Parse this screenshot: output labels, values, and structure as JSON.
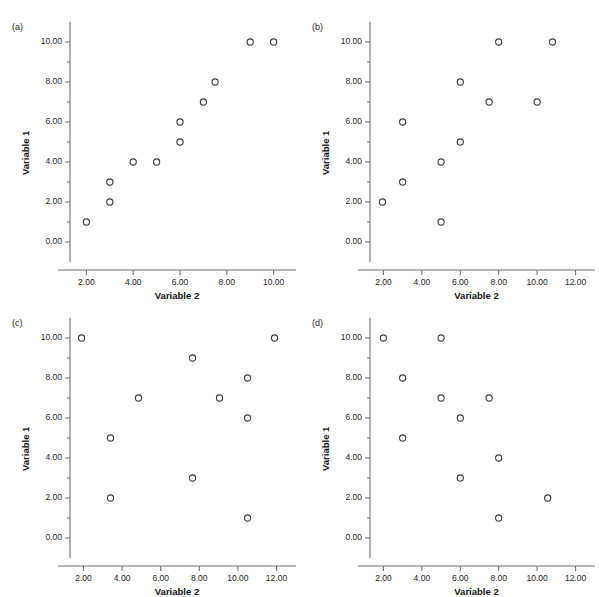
{
  "figure": {
    "background": "#ffffff",
    "marker_color": "#3a3a3a",
    "axis_color": "#6f6f6f",
    "panel_count": 4
  },
  "panels": [
    {
      "label": "(a)",
      "xlabel": "Variable 2",
      "ylabel": "Variable 1",
      "xticks": [
        "2.00",
        "4.00",
        "6.00",
        "8.00",
        "10.00"
      ],
      "xtick_values": [
        2,
        4,
        6,
        8,
        10
      ],
      "yticks": [
        "0.00",
        "2.00",
        "4.00",
        "6.00",
        "8.00",
        "10.00"
      ],
      "ytick_values": [
        0,
        2,
        4,
        6,
        8,
        10
      ],
      "xlim": [
        1.3,
        10.7
      ],
      "ylim": [
        -0.7,
        10.6
      ],
      "points": [
        {
          "x": 2.0,
          "y": 1.0
        },
        {
          "x": 3.0,
          "y": 2.0
        },
        {
          "x": 3.0,
          "y": 3.0
        },
        {
          "x": 4.0,
          "y": 4.0
        },
        {
          "x": 5.0,
          "y": 4.0
        },
        {
          "x": 6.0,
          "y": 5.0
        },
        {
          "x": 6.0,
          "y": 6.0
        },
        {
          "x": 7.0,
          "y": 7.0
        },
        {
          "x": 7.5,
          "y": 8.0
        },
        {
          "x": 9.0,
          "y": 10.0
        },
        {
          "x": 10.0,
          "y": 10.0
        }
      ]
    },
    {
      "label": "(b)",
      "xlabel": "Variable 2",
      "ylabel": "Variable 1",
      "xticks": [
        "2.00",
        "4.00",
        "6.00",
        "8.00",
        "10.00",
        "12.00"
      ],
      "xtick_values": [
        2,
        4,
        6,
        8,
        10,
        12
      ],
      "yticks": [
        "0.00",
        "2.00",
        "4.00",
        "6.00",
        "8.00",
        "10.00"
      ],
      "ytick_values": [
        0,
        2,
        4,
        6,
        8,
        10
      ],
      "xlim": [
        1.3,
        12.7
      ],
      "ylim": [
        -0.7,
        10.6
      ],
      "points": [
        {
          "x": 1.95,
          "y": 2.0
        },
        {
          "x": 3.0,
          "y": 3.0
        },
        {
          "x": 3.0,
          "y": 6.0
        },
        {
          "x": 5.0,
          "y": 1.0
        },
        {
          "x": 5.0,
          "y": 4.0
        },
        {
          "x": 6.0,
          "y": 5.0
        },
        {
          "x": 6.0,
          "y": 8.0
        },
        {
          "x": 7.5,
          "y": 7.0
        },
        {
          "x": 8.0,
          "y": 10.0
        },
        {
          "x": 10.0,
          "y": 7.0
        },
        {
          "x": 10.8,
          "y": 10.0
        }
      ]
    },
    {
      "label": "(c)",
      "xlabel": "Variable 2",
      "ylabel": "Variable 1",
      "xticks": [
        "2.00",
        "4.00",
        "6.00",
        "8.00",
        "10.00",
        "12.00"
      ],
      "xtick_values": [
        2,
        4,
        6,
        8,
        10,
        12
      ],
      "yticks": [
        "0.00",
        "2.00",
        "4.00",
        "6.00",
        "8.00",
        "10.00"
      ],
      "ytick_values": [
        0,
        2,
        4,
        6,
        8,
        10
      ],
      "xlim": [
        1.3,
        12.7
      ],
      "ylim": [
        -0.7,
        10.6
      ],
      "points": [
        {
          "x": 1.9,
          "y": 10.0
        },
        {
          "x": 3.4,
          "y": 2.0
        },
        {
          "x": 3.4,
          "y": 5.0
        },
        {
          "x": 4.85,
          "y": 7.0
        },
        {
          "x": 7.65,
          "y": 3.0
        },
        {
          "x": 7.65,
          "y": 9.0
        },
        {
          "x": 9.05,
          "y": 7.0
        },
        {
          "x": 10.5,
          "y": 1.0
        },
        {
          "x": 10.5,
          "y": 6.0
        },
        {
          "x": 10.5,
          "y": 8.0
        },
        {
          "x": 11.9,
          "y": 10.0
        }
      ]
    },
    {
      "label": "(d)",
      "xlabel": "Variable 2",
      "ylabel": "Variable 1",
      "xticks": [
        "2.00",
        "4.00",
        "6.00",
        "8.00",
        "10.00",
        "12.00"
      ],
      "xtick_values": [
        2,
        4,
        6,
        8,
        10,
        12
      ],
      "yticks": [
        "0.00",
        "2.00",
        "4.00",
        "6.00",
        "8.00",
        "10.00"
      ],
      "ytick_values": [
        0,
        2,
        4,
        6,
        8,
        10
      ],
      "xlim": [
        1.3,
        12.7
      ],
      "ylim": [
        -0.7,
        10.6
      ],
      "points": [
        {
          "x": 2.0,
          "y": 10.0
        },
        {
          "x": 3.0,
          "y": 5.0
        },
        {
          "x": 3.0,
          "y": 8.0
        },
        {
          "x": 5.0,
          "y": 7.0
        },
        {
          "x": 5.0,
          "y": 10.0
        },
        {
          "x": 6.0,
          "y": 3.0
        },
        {
          "x": 6.0,
          "y": 6.0
        },
        {
          "x": 7.5,
          "y": 7.0
        },
        {
          "x": 8.0,
          "y": 1.0
        },
        {
          "x": 8.0,
          "y": 4.0
        },
        {
          "x": 10.55,
          "y": 2.0
        }
      ]
    }
  ],
  "chart_data": [
    {
      "type": "scatter",
      "title": "(a)",
      "xlabel": "Variable 2",
      "ylabel": "Variable 1",
      "xlim": [
        1.3,
        10.7
      ],
      "ylim": [
        -0.7,
        10.6
      ],
      "xticks": [
        2,
        4,
        6,
        8,
        10
      ],
      "yticks": [
        0,
        2,
        4,
        6,
        8,
        10
      ],
      "grid": false,
      "legend": "none",
      "marker": "open-circle",
      "x": [
        2.0,
        3.0,
        3.0,
        4.0,
        5.0,
        6.0,
        6.0,
        7.0,
        7.5,
        9.0,
        10.0
      ],
      "y": [
        1.0,
        2.0,
        3.0,
        4.0,
        4.0,
        5.0,
        6.0,
        7.0,
        8.0,
        10.0,
        10.0
      ],
      "annotation": "strong positive linear relationship"
    },
    {
      "type": "scatter",
      "title": "(b)",
      "xlabel": "Variable 2",
      "ylabel": "Variable 1",
      "xlim": [
        1.3,
        12.7
      ],
      "ylim": [
        -0.7,
        10.6
      ],
      "xticks": [
        2,
        4,
        6,
        8,
        10,
        12
      ],
      "yticks": [
        0,
        2,
        4,
        6,
        8,
        10
      ],
      "grid": false,
      "legend": "none",
      "marker": "open-circle",
      "x": [
        1.95,
        3.0,
        3.0,
        5.0,
        5.0,
        6.0,
        6.0,
        7.5,
        8.0,
        10.0,
        10.8
      ],
      "y": [
        2.0,
        3.0,
        6.0,
        1.0,
        4.0,
        5.0,
        8.0,
        7.0,
        10.0,
        7.0,
        10.0
      ],
      "annotation": "moderate positive relationship"
    },
    {
      "type": "scatter",
      "title": "(c)",
      "xlabel": "Variable 2",
      "ylabel": "Variable 1",
      "xlim": [
        1.3,
        12.7
      ],
      "ylim": [
        -0.7,
        10.6
      ],
      "xticks": [
        2,
        4,
        6,
        8,
        10,
        12
      ],
      "yticks": [
        0,
        2,
        4,
        6,
        8,
        10
      ],
      "grid": false,
      "legend": "none",
      "marker": "open-circle",
      "x": [
        1.9,
        3.4,
        3.4,
        4.85,
        7.65,
        7.65,
        9.05,
        10.5,
        10.5,
        10.5,
        11.9
      ],
      "y": [
        10.0,
        2.0,
        5.0,
        7.0,
        3.0,
        9.0,
        7.0,
        1.0,
        6.0,
        8.0,
        10.0
      ],
      "annotation": "no relationship / random scatter"
    },
    {
      "type": "scatter",
      "title": "(d)",
      "xlabel": "Variable 2",
      "ylabel": "Variable 1",
      "xlim": [
        1.3,
        12.7
      ],
      "ylim": [
        -0.7,
        10.6
      ],
      "xticks": [
        2,
        4,
        6,
        8,
        10,
        12
      ],
      "yticks": [
        0,
        2,
        4,
        6,
        8,
        10
      ],
      "grid": false,
      "legend": "none",
      "marker": "open-circle",
      "x": [
        2.0,
        3.0,
        3.0,
        5.0,
        5.0,
        6.0,
        6.0,
        7.5,
        8.0,
        8.0,
        10.55
      ],
      "y": [
        10.0,
        5.0,
        8.0,
        7.0,
        10.0,
        3.0,
        6.0,
        7.0,
        1.0,
        4.0,
        2.0
      ],
      "annotation": "moderate negative relationship"
    }
  ]
}
